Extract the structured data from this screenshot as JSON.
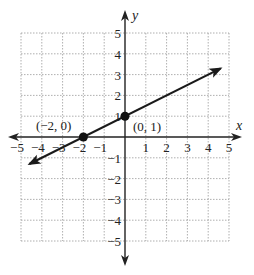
{
  "chart_data": {
    "type": "line",
    "title": "",
    "xlabel": "x",
    "ylabel": "y",
    "xlim": [
      -5,
      5
    ],
    "ylim": [
      -5,
      5
    ],
    "grid": true,
    "x_ticks": [
      "-5",
      "-4",
      "-3",
      "-2",
      "-1",
      "1",
      "2",
      "3",
      "4",
      "5"
    ],
    "y_ticks": [
      "5",
      "4",
      "3",
      "2",
      "1",
      "-1",
      "-2",
      "-3",
      "-4",
      "-5"
    ],
    "series": [
      {
        "name": "line",
        "equation": "y = 0.5x + 1",
        "x": [
          -4.6,
          4.6
        ],
        "y": [
          -1.3,
          3.3
        ],
        "arrows_both_ends": true
      }
    ],
    "points": [
      {
        "x": -2,
        "y": 0,
        "label": "(−2, 0)"
      },
      {
        "x": 0,
        "y": 1,
        "label": "(0, 1)"
      }
    ]
  }
}
